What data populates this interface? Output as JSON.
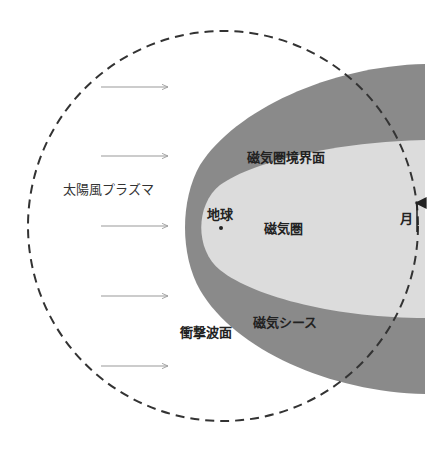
{
  "diagram": {
    "labels": {
      "solar_wind": "太陽風プラズマ",
      "magnetopause": "磁気圏境界面",
      "earth": "地球",
      "magnetosphere": "磁気圏",
      "moon": "月",
      "bow_shock": "衝撃波面",
      "magnetosheath": "磁気シース"
    },
    "arrows": {
      "count": 5,
      "direction": "right",
      "y_positions": [
        87,
        156,
        226,
        296,
        366
      ]
    },
    "moon_orbit": {
      "style": "dashed",
      "direction": "counterclockwise"
    },
    "colors": {
      "magnetosheath": "#8a8a8a",
      "magnetosphere": "#dcdcdc",
      "orbit": "#333333",
      "arrow": "#999999",
      "background": "#ffffff"
    }
  }
}
